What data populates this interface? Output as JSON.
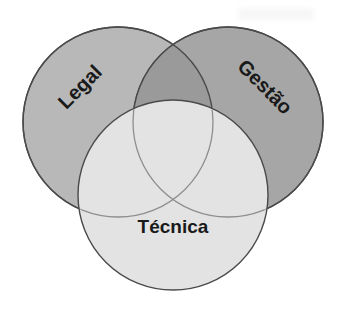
{
  "figure": {
    "type": "venn-diagram",
    "set_count": 3,
    "background_color": "#ffffff",
    "outline_color": "#4a4a4a",
    "label_color": "#1a1a1a"
  },
  "chart_data": {
    "type": "venn",
    "title": "",
    "categories": [
      "Legal",
      "Gestão",
      "Técnica"
    ],
    "sets": [
      {
        "name": "Legal",
        "label": "Legal",
        "fill": "#b8b8b8",
        "cx": 118,
        "cy": 122,
        "r": 95,
        "label_x": 81,
        "label_y": 88,
        "label_rotation": -45,
        "font_size": 20
      },
      {
        "name": "Gestão",
        "label": "Gestão",
        "fill": "#a6a6a6",
        "cx": 228,
        "cy": 122,
        "r": 95,
        "label_x": 264,
        "label_y": 88,
        "label_rotation": 45,
        "font_size": 20
      },
      {
        "name": "Técnica",
        "label": "Técnica",
        "fill": "#e3e3e3",
        "cx": 173,
        "cy": 195,
        "r": 95,
        "label_x": 173,
        "label_y": 228,
        "label_rotation": 0,
        "font_size": 19
      }
    ],
    "overlaps": [
      {
        "name": "legal-gestao-overlap",
        "sets": [
          "Legal",
          "Gestão"
        ],
        "fill": "#9a9a9a"
      },
      {
        "name": "legal-tecnica-overlap",
        "sets": [
          "Legal",
          "Técnica"
        ],
        "fill": "#e0e0e0"
      },
      {
        "name": "gestao-tecnica-overlap",
        "sets": [
          "Gestão",
          "Técnica"
        ],
        "fill": "#e0e0e0"
      },
      {
        "name": "triple-overlap",
        "sets": [
          "Legal",
          "Gestão",
          "Técnica"
        ],
        "fill": "#dedede"
      }
    ]
  }
}
